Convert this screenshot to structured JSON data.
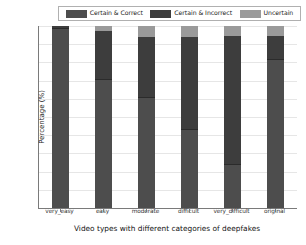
{
  "chart_data": {
    "type": "bar",
    "title": "",
    "xlabel": "Video types with different categories of deepfakes",
    "ylabel": "Percentage (%)",
    "ylim": [
      0,
      100
    ],
    "yticks": [
      0,
      10,
      20,
      30,
      40,
      50,
      60,
      70,
      80,
      90,
      100
    ],
    "ytick_labels": [
      "0",
      "10",
      "20",
      "30",
      "40",
      "50",
      "60",
      "70",
      "80",
      "90",
      "100"
    ],
    "grid": true,
    "stacked": true,
    "legend_position": "upper center (outside axes)",
    "categories": [
      "very_easy",
      "easy",
      "moderate",
      "difficult",
      "very_difficult",
      "original"
    ],
    "series": [
      {
        "name": "Certain & Correct",
        "color": "#4d4d4d",
        "values": [
          99,
          70.5,
          61,
          43,
          24,
          82
        ]
      },
      {
        "name": "Certain & Incorrect",
        "color": "#3d3d3d",
        "values": [
          1,
          26.5,
          33,
          51,
          70.5,
          12.5
        ]
      },
      {
        "name": "Uncertain",
        "color": "#9a9a9a",
        "values": [
          0,
          3,
          6,
          6,
          5.5,
          5.5
        ]
      }
    ]
  },
  "legend": {
    "entries": [
      {
        "label": "Certain & Correct"
      },
      {
        "label": "Certain & Incorrect"
      },
      {
        "label": "Uncertain"
      }
    ]
  }
}
